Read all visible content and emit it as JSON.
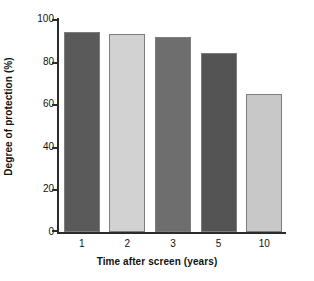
{
  "chart_data": {
    "type": "bar",
    "title": "",
    "xlabel": "Time after screen (years)",
    "ylabel": "Degree of protection (%)",
    "categories": [
      "1",
      "2",
      "3",
      "5",
      "10"
    ],
    "values": [
      94,
      93,
      91.5,
      84,
      65
    ],
    "ylim": [
      0,
      100
    ],
    "yticks": [
      0,
      20,
      40,
      60,
      80,
      100
    ],
    "ytick_labels": [
      "0",
      "20",
      "40",
      "60",
      "80",
      "100"
    ],
    "grid": false,
    "legend": "none",
    "bar_colors": [
      "#5a5a5a",
      "#d2d2d2",
      "#6e6e6e",
      "#545454",
      "#c8c8c8"
    ],
    "bar_edge_color": "#7d7d7d",
    "axis_color": "#2b2b2b",
    "background_color": "#ffffff",
    "series": [
      {
        "name": "Degree of protection",
        "values": [
          94,
          93,
          91.5,
          84,
          65
        ]
      }
    ]
  },
  "axes": {
    "y_title": "Degree of protection (%)",
    "x_title": "Time after screen (years)"
  }
}
